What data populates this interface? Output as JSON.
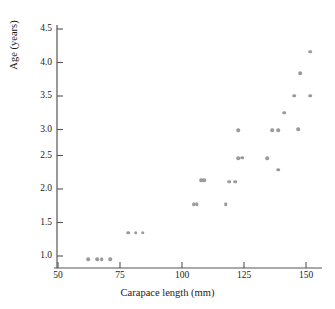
{
  "chart_data": {
    "type": "scatter",
    "title": "",
    "xlabel": "Carapace length (mm)",
    "ylabel": "Age (years)",
    "xlim": [
      46,
      154
    ],
    "ylim": [
      0.85,
      4.6
    ],
    "xticks": [
      50,
      75,
      100,
      125,
      150
    ],
    "yticks": [
      1.0,
      1.5,
      2.0,
      2.5,
      3.0,
      3.5,
      4.0,
      4.5
    ],
    "xtick_labels": [
      "50",
      "75",
      "100",
      "125",
      "150"
    ],
    "ytick_labels": [
      "1.0",
      "1.5",
      "2.0",
      "2.5",
      "3.0",
      "3.5",
      "4.0",
      "4.5"
    ],
    "grid": false,
    "legend": false,
    "marker": {
      "shape": "circle",
      "color": "#9a9a9a",
      "size_px": 3.6
    },
    "series": [
      {
        "name": "turtles",
        "color": "#9a9a9a",
        "points": [
          {
            "x": 62.1,
            "y": 0.95
          },
          {
            "x": 65.7,
            "y": 0.95
          },
          {
            "x": 67.7,
            "y": 0.95
          },
          {
            "x": 71.0,
            "y": 0.95
          },
          {
            "x": 78.2,
            "y": 1.35
          },
          {
            "x": 81.4,
            "y": 1.35
          },
          {
            "x": 84.2,
            "y": 1.35
          },
          {
            "x": 104.8,
            "y": 1.77
          },
          {
            "x": 106.0,
            "y": 1.77
          },
          {
            "x": 117.7,
            "y": 1.77
          },
          {
            "x": 107.7,
            "y": 2.13
          },
          {
            "x": 108.9,
            "y": 2.13
          },
          {
            "x": 119.0,
            "y": 2.11
          },
          {
            "x": 121.4,
            "y": 2.11
          },
          {
            "x": 122.6,
            "y": 2.46
          },
          {
            "x": 124.2,
            "y": 2.47
          },
          {
            "x": 134.3,
            "y": 2.46
          },
          {
            "x": 138.7,
            "y": 2.29
          },
          {
            "x": 122.6,
            "y": 2.88
          },
          {
            "x": 136.3,
            "y": 2.88
          },
          {
            "x": 138.7,
            "y": 2.88
          },
          {
            "x": 146.8,
            "y": 2.89
          },
          {
            "x": 141.1,
            "y": 3.14
          },
          {
            "x": 145.2,
            "y": 3.39
          },
          {
            "x": 151.6,
            "y": 3.39
          },
          {
            "x": 147.6,
            "y": 3.73
          },
          {
            "x": 151.6,
            "y": 4.05
          }
        ]
      }
    ]
  },
  "axes": {
    "x_title": "Carapace length (mm)",
    "y_title": "Age (years)"
  }
}
